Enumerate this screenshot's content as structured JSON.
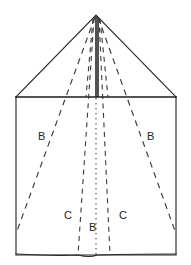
{
  "figure": {
    "background_color": "#ffffff",
    "ink_color": "#1b1b1b",
    "dash_color": "#3a3a3a",
    "canvas": {
      "width": 191,
      "height": 265
    },
    "outline": {
      "apex": {
        "x": 96,
        "y": 15
      },
      "shoulder_left": {
        "x": 16,
        "y": 97
      },
      "shoulder_right": {
        "x": 176,
        "y": 97
      },
      "bottom_left": {
        "x": 16,
        "y": 255
      },
      "bottom_right": {
        "x": 176,
        "y": 255
      }
    },
    "center_ridge": {
      "x_top": 96,
      "y_top": 16,
      "x_bottom": 97,
      "y_bottom": 97
    },
    "fold_lines": [
      {
        "name": "outer-fold-left-B",
        "style": "dashed",
        "from": {
          "x": 95,
          "y": 17
        },
        "to": {
          "x": 17,
          "y": 231
        }
      },
      {
        "name": "outer-fold-right-B",
        "style": "dashed",
        "from": {
          "x": 97,
          "y": 17
        },
        "to": {
          "x": 175,
          "y": 231
        }
      },
      {
        "name": "inner-fold-left-C",
        "style": "dashed",
        "from": {
          "x": 95,
          "y": 17
        },
        "to": {
          "x": 78,
          "y": 255
        }
      },
      {
        "name": "inner-fold-right-C",
        "style": "dashed",
        "from": {
          "x": 97,
          "y": 17
        },
        "to": {
          "x": 110,
          "y": 255
        }
      },
      {
        "name": "center-fold-B",
        "style": "dotted",
        "from": {
          "x": 96,
          "y": 97
        },
        "to": {
          "x": 96,
          "y": 255
        }
      }
    ],
    "labels": [
      {
        "id": "label-b-left",
        "text": "B",
        "x": 38,
        "y": 131
      },
      {
        "id": "label-b-right",
        "text": "B",
        "x": 147,
        "y": 131
      },
      {
        "id": "label-c-left",
        "text": "C",
        "x": 64,
        "y": 210
      },
      {
        "id": "label-c-right",
        "text": "C",
        "x": 119,
        "y": 210
      },
      {
        "id": "label-b-center",
        "text": "B",
        "x": 89,
        "y": 222
      }
    ]
  }
}
